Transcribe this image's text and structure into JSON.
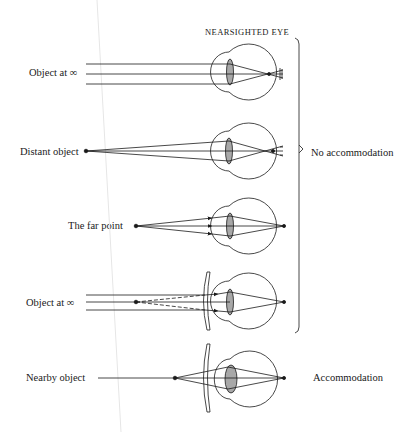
{
  "title": "NEARSIGHTED EYE",
  "panels": [
    {
      "id": "object-infinity",
      "label": "Object at ∞",
      "correction_lens": false,
      "rays": "parallel",
      "focus": "in-front-of-retina"
    },
    {
      "id": "distant-object",
      "label": "Distant object",
      "correction_lens": false,
      "rays": "diverging-from-point",
      "focus": "in-front-of-retina"
    },
    {
      "id": "far-point",
      "label": "The far point",
      "correction_lens": false,
      "rays": "diverging-from-far-point",
      "focus": "on-retina"
    },
    {
      "id": "object-infinity-corrected",
      "label": "Object at ∞",
      "correction_lens": true,
      "rays": "parallel-diverged-by-concave-lens",
      "focus": "on-retina"
    },
    {
      "id": "nearby-object",
      "label": "Nearby object",
      "correction_lens": true,
      "rays": "diverging-from-near-point",
      "focus": "on-retina"
    }
  ],
  "groups": {
    "no_accommodation": "No accommodation",
    "accommodation": "Accommodation"
  },
  "colors": {
    "line": "#1a1a1a",
    "lens_fill": "#a8a8a8",
    "background": "#ffffff"
  }
}
